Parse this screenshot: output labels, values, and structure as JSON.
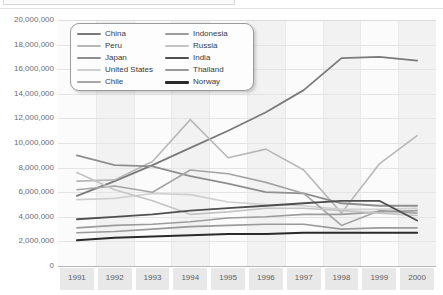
{
  "chart_data": {
    "type": "line",
    "title": "",
    "subtitle": "",
    "xlabel": "",
    "ylabel": "",
    "categories": [
      "1991",
      "1992",
      "1993",
      "1994",
      "1995",
      "1996",
      "1997",
      "1998",
      "1999",
      "2000"
    ],
    "x": [
      1991,
      1992,
      1993,
      1994,
      1995,
      1996,
      1997,
      1998,
      1999,
      2000
    ],
    "ylim": [
      0,
      20000000
    ],
    "xlim": [
      1991,
      2000
    ],
    "ytick_labels": [
      "20,000,000",
      "18,000,000",
      "16,000,000",
      "14,000,000",
      "12,000,000",
      "10,000,000",
      "8,000,000",
      "6,000,000",
      "4,000,000",
      "2,000,000",
      "0"
    ],
    "ytick_values": [
      20000000,
      18000000,
      16000000,
      14000000,
      12000000,
      10000000,
      8000000,
      6000000,
      4000000,
      2000000,
      0
    ],
    "grid": true,
    "legend_position": "top-left-inside",
    "legend_columns": 2,
    "series": [
      {
        "name": "China",
        "color": "#7a7a7a",
        "width": 1.8,
        "values": [
          5700000,
          6900000,
          8200000,
          9600000,
          11000000,
          12500000,
          14300000,
          16900000,
          17000000,
          16700000
        ]
      },
      {
        "name": "Peru",
        "color": "#b8b8b8",
        "width": 1.6,
        "values": [
          6900000,
          7000000,
          8500000,
          11900000,
          8800000,
          9500000,
          7800000,
          4300000,
          8300000,
          10600000
        ]
      },
      {
        "name": "Japan",
        "color": "#8f8f8f",
        "width": 1.8,
        "values": [
          9000000,
          8200000,
          8100000,
          7300000,
          6700000,
          6000000,
          5900000,
          5100000,
          4900000,
          4900000
        ]
      },
      {
        "name": "United States",
        "color": "#cfcfcf",
        "width": 1.6,
        "values": [
          5400000,
          5500000,
          5900000,
          5800000,
          5200000,
          5000000,
          4900000,
          4600000,
          4600000,
          4700000
        ]
      },
      {
        "name": "Chile",
        "color": "#a5a5a5",
        "width": 1.6,
        "values": [
          6200000,
          6500000,
          6000000,
          7800000,
          7500000,
          6800000,
          5900000,
          3300000,
          4500000,
          4300000
        ]
      },
      {
        "name": "Indonesia",
        "color": "#9c9c9c",
        "width": 1.6,
        "values": [
          3100000,
          3300000,
          3400000,
          3600000,
          3900000,
          4000000,
          4200000,
          4200000,
          4400000,
          4500000
        ]
      },
      {
        "name": "Russia",
        "color": "#c4c4c4",
        "width": 1.6,
        "values": [
          7600000,
          6200000,
          5300000,
          4200000,
          4400000,
          4700000,
          4700000,
          4500000,
          4300000,
          4100000
        ]
      },
      {
        "name": "India",
        "color": "#4f4f4f",
        "width": 1.8,
        "values": [
          3800000,
          4000000,
          4200000,
          4500000,
          4700000,
          4900000,
          5100000,
          5300000,
          5300000,
          3700000
        ]
      },
      {
        "name": "Thailand",
        "color": "#9a9a9a",
        "width": 1.6,
        "values": [
          2700000,
          2800000,
          3000000,
          3200000,
          3300000,
          3400000,
          3400000,
          3000000,
          3100000,
          3100000
        ]
      },
      {
        "name": "Norway",
        "color": "#2b2b2b",
        "width": 2.0,
        "values": [
          2100000,
          2300000,
          2400000,
          2500000,
          2600000,
          2600000,
          2700000,
          2700000,
          2700000,
          2700000
        ]
      }
    ]
  },
  "axes": {
    "y_ticks": [
      "20,000,000",
      "18,000,000",
      "16,000,000",
      "14,000,000",
      "12,000,000",
      "10,000,000",
      "8,000,000",
      "6,000,000",
      "4,000,000",
      "2,000,000",
      "0"
    ],
    "x_ticks": [
      "1991",
      "1992",
      "1993",
      "1994",
      "1995",
      "1996",
      "1997",
      "1998",
      "1999",
      "2000"
    ]
  },
  "legend": {
    "columns": [
      [
        {
          "label": "China",
          "color": "#7a7a7a",
          "width": 2.2
        },
        {
          "label": "Peru",
          "color": "#b8b8b8",
          "width": 1.8
        },
        {
          "label": "Japan",
          "color": "#8f8f8f",
          "width": 2.2
        },
        {
          "label": "United States",
          "color": "#cfcfcf",
          "width": 1.8
        },
        {
          "label": "Chile",
          "color": "#a5a5a5",
          "width": 1.8
        }
      ],
      [
        {
          "label": "Indonesia",
          "color": "#9c9c9c",
          "width": 1.8
        },
        {
          "label": "Russia",
          "color": "#c4c4c4",
          "width": 1.8
        },
        {
          "label": "India",
          "color": "#4f4f4f",
          "width": 2.4
        },
        {
          "label": "Thailand",
          "color": "#9a9a9a",
          "width": 1.8
        },
        {
          "label": "Norway",
          "color": "#2b2b2b",
          "width": 2.6
        }
      ]
    ]
  },
  "colors": {
    "plot_background": "#fbfbfb",
    "band": "#efefef",
    "gridline": "#e4e4e4",
    "axis_text": "#6d6d6d",
    "xaxis_band": "#e8e8e8"
  }
}
